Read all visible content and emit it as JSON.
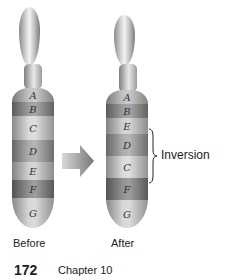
{
  "figure": {
    "before": {
      "label": "Before",
      "bands": [
        {
          "letter": "A",
          "color": "#b9b9b9"
        },
        {
          "letter": "B",
          "color": "#8c8c8c"
        },
        {
          "letter": "C",
          "color": "#d4d4d4"
        },
        {
          "letter": "D",
          "color": "#9e9e9e"
        },
        {
          "letter": "E",
          "color": "#c9c9c9"
        },
        {
          "letter": "F",
          "color": "#7f7f7f"
        },
        {
          "letter": "G",
          "color": "#d0d0d0"
        }
      ]
    },
    "after": {
      "label": "After",
      "bands": [
        {
          "letter": "A",
          "color": "#b9b9b9"
        },
        {
          "letter": "B",
          "color": "#8c8c8c"
        },
        {
          "letter": "E",
          "color": "#c9c9c9"
        },
        {
          "letter": "D",
          "color": "#9e9e9e"
        },
        {
          "letter": "C",
          "color": "#d4d4d4"
        },
        {
          "letter": "F",
          "color": "#7f7f7f"
        },
        {
          "letter": "G",
          "color": "#d0d0d0"
        }
      ]
    },
    "annotation": "Inversion"
  },
  "footer": {
    "page_number": "172",
    "chapter": "Chapter 10"
  }
}
